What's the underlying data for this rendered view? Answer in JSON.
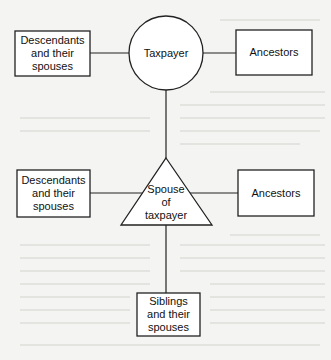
{
  "diagram": {
    "type": "relationship-diagram",
    "colors": {
      "stroke": "#222222",
      "fill": "#ffffff",
      "background": "#f4f4f2"
    },
    "nodes": {
      "taxpayer": {
        "label": "Taxpayer",
        "shape": "circle"
      },
      "taxpayer_descendants": {
        "label": "Descendants\nand their\nspouses",
        "shape": "rectangle"
      },
      "taxpayer_ancestors": {
        "label": "Ancestors",
        "shape": "rectangle"
      },
      "spouse": {
        "label": "Spouse\nof\ntaxpayer",
        "shape": "triangle"
      },
      "spouse_descendants": {
        "label": "Descendants\nand their\nspouses",
        "shape": "rectangle"
      },
      "spouse_ancestors": {
        "label": "Ancestors",
        "shape": "rectangle"
      },
      "siblings": {
        "label": "Siblings\nand their\nspouses",
        "shape": "rectangle"
      }
    },
    "edges": [
      {
        "from": "taxpayer_descendants",
        "to": "taxpayer"
      },
      {
        "from": "taxpayer",
        "to": "taxpayer_ancestors"
      },
      {
        "from": "taxpayer",
        "to": "spouse"
      },
      {
        "from": "spouse_descendants",
        "to": "spouse"
      },
      {
        "from": "spouse",
        "to": "spouse_ancestors"
      },
      {
        "from": "spouse",
        "to": "siblings"
      }
    ]
  }
}
